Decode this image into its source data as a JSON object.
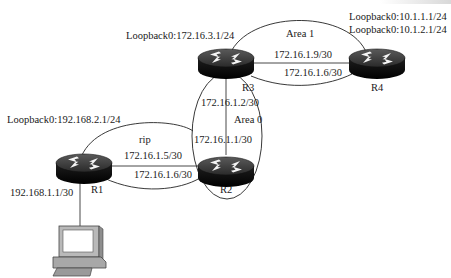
{
  "diagram": {
    "type": "network-topology",
    "routers": [
      {
        "id": "R1",
        "label": "R1"
      },
      {
        "id": "R2",
        "label": "R2"
      },
      {
        "id": "R3",
        "label": "R3"
      },
      {
        "id": "R4",
        "label": "R4"
      }
    ],
    "hosts": [
      {
        "id": "PC",
        "label": ""
      }
    ],
    "areas": {
      "area0": "Area 0",
      "area1": "Area 1",
      "rip": "rip"
    },
    "loopbacks": {
      "r1": "Loopback0:192.168.2.1/24",
      "r3": "Loopback0:172.16.3.1/24",
      "r4_a": "Loopback0:10.1.1.1/24",
      "r4_b": "Loopback0:10.1.2.1/24"
    },
    "links": {
      "r1_pc": "192.168.1.1/30",
      "r1_r2_a": "172.16.1.5/30",
      "r1_r2_b": "172.16.1.6/30",
      "r3_r2_r3side": "172.16.1.2/30",
      "r3_r2_r2side": "172.16.1.1/30",
      "r3_r4_a": "172.16.1.9/30",
      "r3_r4_b": "172.16.1.6/30"
    },
    "connections": [
      {
        "from": "R1",
        "to": "PC",
        "label": "192.168.1.1/30"
      },
      {
        "from": "R1",
        "to": "R2",
        "label": "172.16.1.5/30"
      },
      {
        "from": "R2",
        "to": "R3",
        "label": "172.16.1.1/30"
      },
      {
        "from": "R3",
        "to": "R4",
        "label": "172.16.1.9/30"
      }
    ]
  }
}
